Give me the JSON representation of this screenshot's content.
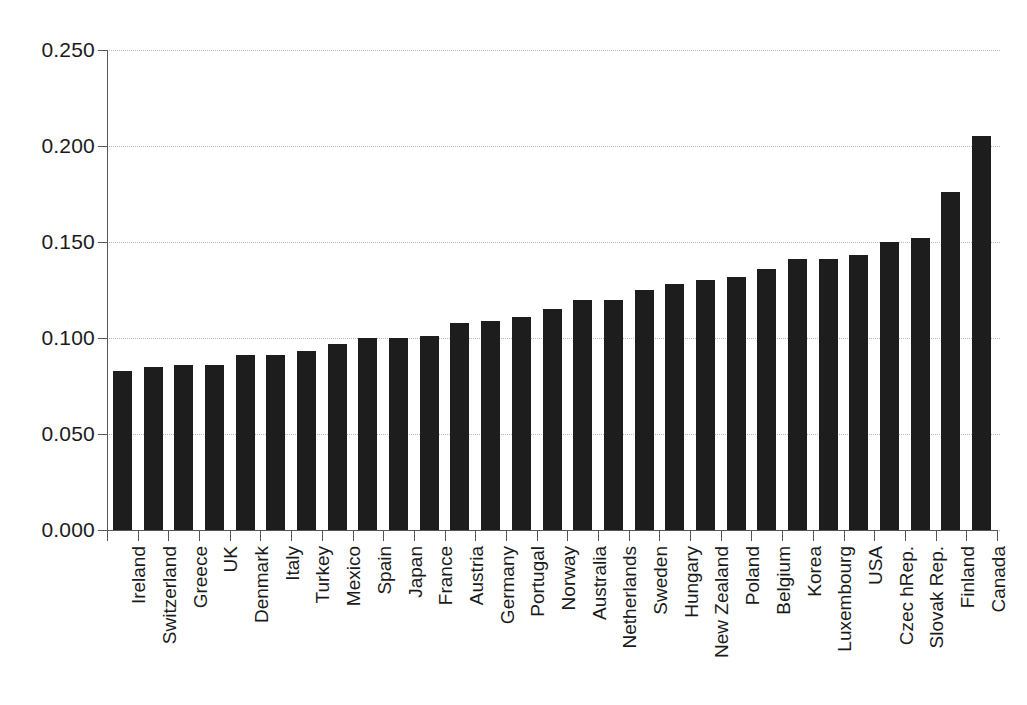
{
  "chart_data": {
    "type": "bar",
    "title": "",
    "subtitle": "",
    "xlabel": "",
    "ylabel": "",
    "ylim": [
      0.0,
      0.25
    ],
    "ytick_labels": [
      "0.250",
      "0.200",
      "0.150",
      "0.100",
      "0.050",
      "0.000"
    ],
    "ytick_values": [
      0.25,
      0.2,
      0.15,
      0.1,
      0.05,
      0.0
    ],
    "grid": true,
    "legend": false,
    "bar_color": "#1d1d1d",
    "grid_color": "#b9b9b9",
    "axis_color": "#555555",
    "categories": [
      "Ireland",
      "Switzerland",
      "Greece",
      "UK",
      "Denmark",
      "Italy",
      "Turkey",
      "Mexico",
      "Spain",
      "Japan",
      "France",
      "Austria",
      "Germany",
      "Portugal",
      "Norway",
      "Australia",
      "Netherlands",
      "Sweden",
      "Hungary",
      "New Zealand",
      "Poland",
      "Belgium",
      "Korea",
      "Luxembourg",
      "USA",
      "Czec hRep.",
      "Slovak Rep.",
      "Finland",
      "Canada"
    ],
    "values": [
      0.083,
      0.085,
      0.086,
      0.086,
      0.091,
      0.091,
      0.093,
      0.097,
      0.1,
      0.1,
      0.101,
      0.108,
      0.109,
      0.111,
      0.115,
      0.12,
      0.12,
      0.125,
      0.128,
      0.13,
      0.132,
      0.136,
      0.141,
      0.141,
      0.143,
      0.15,
      0.152,
      0.176,
      0.205
    ]
  }
}
